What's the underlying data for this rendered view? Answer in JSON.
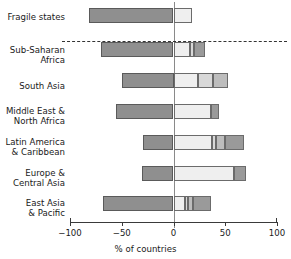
{
  "chart_data": {
    "type": "bar",
    "title": "",
    "xlabel": "% of countries",
    "ylabel": "",
    "xlim": [
      -100,
      100
    ],
    "xticks": [
      -100,
      -50,
      0,
      50,
      100
    ],
    "xtick_labels": [
      "−100",
      "−50",
      "0",
      "50",
      "100"
    ],
    "grid": false,
    "legend": "none",
    "orientation": "horizontal-diverging-stacked",
    "categories": [
      "Fragile states",
      "Sub-Saharan\nAfrica",
      "South Asia",
      "Middle East &\nNorth Africa",
      "Latin America\n& Caribbean",
      "Europe &\nCentral Asia",
      "East Asia\n& Pacific"
    ],
    "separator_after_category": "Fragile states",
    "series": [
      {
        "name": "negative",
        "color": "#8f8f8f",
        "values": [
          -82,
          -70,
          -50,
          -56,
          -29,
          -30,
          -68
        ]
      },
      {
        "name": "positive-1",
        "color": "#efefef",
        "values": [
          18,
          16,
          24,
          36,
          37,
          58,
          11
        ]
      },
      {
        "name": "positive-2",
        "color": "#d8d8d8",
        "values": [
          0,
          4,
          14,
          0,
          4,
          0,
          3
        ]
      },
      {
        "name": "positive-3",
        "color": "#bdbdbd",
        "values": [
          0,
          0,
          15,
          0,
          9,
          0,
          5
        ]
      },
      {
        "name": "positive-4",
        "color": "#9a9a9a",
        "values": [
          0,
          10,
          0,
          7.5,
          18,
          12,
          17
        ]
      }
    ],
    "row_totals_positive": [
      18,
      30,
      53,
      43.5,
      68,
      70,
      36
    ],
    "bar_height_px": 15,
    "colors": {
      "negative": "#8f8f8f",
      "seg1": "#efefef",
      "seg2": "#d8d8d8",
      "seg3": "#bdbdbd",
      "seg4": "#9a9a9a",
      "outline": "#5a5a5a",
      "axis": "#3a3a3a",
      "zero_line": "#8a8a8a",
      "text": "#1a1a1a",
      "background": "#ffffff"
    }
  }
}
